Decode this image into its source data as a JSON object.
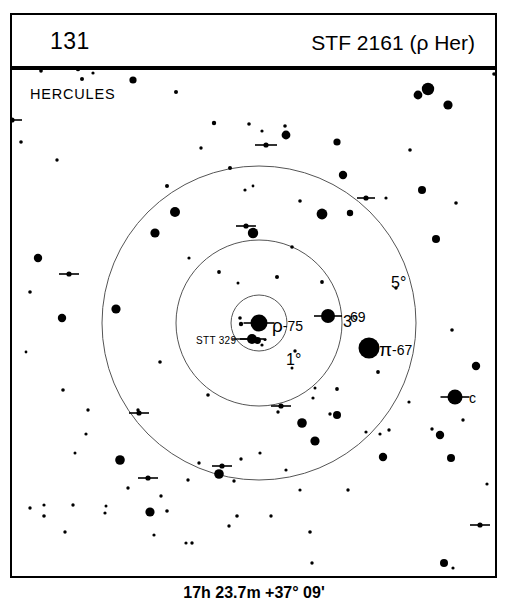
{
  "header": {
    "chart_number": "131",
    "title": "STF 2161 (ρ Her)"
  },
  "caption": "17h 23.7m  +37° 09'",
  "chart": {
    "constellation": "HERCULES",
    "center_ra": "17h 23.7m",
    "center_dec": "+37° 09'",
    "circles": [
      {
        "label": "1°",
        "radius_deg": 1
      },
      {
        "label": "3°",
        "radius_deg": 3
      },
      {
        "label": "5°",
        "radius_deg": 5
      }
    ],
    "star_labels": {
      "rho_greek": "ρ",
      "rho_number": "-75",
      "pi_greek": "π",
      "pi_number": "-67",
      "flamsteed_69": "69",
      "bayer_c": "c",
      "stt329": "STT 329"
    }
  },
  "chart_data": {
    "type": "scatter",
    "title": "STF 2161 (ρ Her)",
    "subtitle": "HERCULES",
    "xlabel": "",
    "ylabel": "",
    "projection": "finder chart, field 10°",
    "center": {
      "x": 259,
      "y": 323,
      "ra": "17h 23.7m",
      "dec": "+37° 09'"
    },
    "grid": false,
    "legend": "none",
    "rings": [
      {
        "label": "1°",
        "radius_px": 28,
        "label_x": 287,
        "label_y": 290
      },
      {
        "label": "3°",
        "radius_px": 83,
        "label_x": 344,
        "label_y": 252
      },
      {
        "label": "5°",
        "radius_px": 157,
        "label_x": 392,
        "label_y": 213
      }
    ],
    "named_stars": [
      {
        "name": "ρ",
        "number": "-75",
        "x": 259,
        "y": 323,
        "r": 8.5,
        "double": true
      },
      {
        "name": "STT 329",
        "x": 252,
        "y": 339,
        "r": 5,
        "double": true
      },
      {
        "name": "69",
        "x": 328,
        "y": 316,
        "r": 7,
        "double": true
      },
      {
        "name": "π",
        "number": "-67",
        "x": 369,
        "y": 348,
        "r": 10.5,
        "double": false
      },
      {
        "name": "c",
        "x": 455,
        "y": 397,
        "r": 7.5,
        "double": true
      }
    ],
    "field_stars": [
      {
        "x": 41,
        "y": 71,
        "r": 1.8
      },
      {
        "x": 78,
        "y": 69,
        "r": 2.2
      },
      {
        "x": 82,
        "y": 79,
        "r": 2.0
      },
      {
        "x": 93,
        "y": 73,
        "r": 1.6
      },
      {
        "x": 133,
        "y": 80,
        "r": 3.6
      },
      {
        "x": 176,
        "y": 92,
        "r": 2.0
      },
      {
        "x": 214,
        "y": 123,
        "r": 2.2
      },
      {
        "x": 249,
        "y": 124,
        "r": 1.8
      },
      {
        "x": 262,
        "y": 131,
        "r": 1.6
      },
      {
        "x": 286,
        "y": 135,
        "r": 4.4
      },
      {
        "x": 285,
        "y": 126,
        "r": 1.8
      },
      {
        "x": 337,
        "y": 142,
        "r": 3.6
      },
      {
        "x": 418,
        "y": 95,
        "r": 4.4
      },
      {
        "x": 428,
        "y": 89,
        "r": 6.2
      },
      {
        "x": 448,
        "y": 105,
        "r": 4.6
      },
      {
        "x": 494,
        "y": 74,
        "r": 1.8
      },
      {
        "x": 167,
        "y": 186,
        "r": 2.0
      },
      {
        "x": 230,
        "y": 168,
        "r": 2.0
      },
      {
        "x": 343,
        "y": 175,
        "r": 4.2
      },
      {
        "x": 410,
        "y": 150,
        "r": 1.8
      },
      {
        "x": 175,
        "y": 212,
        "r": 5.0
      },
      {
        "x": 245,
        "y": 190,
        "r": 1.6
      },
      {
        "x": 253,
        "y": 186,
        "r": 1.4
      },
      {
        "x": 300,
        "y": 201,
        "r": 1.8
      },
      {
        "x": 322,
        "y": 214,
        "r": 5.4
      },
      {
        "x": 350,
        "y": 213,
        "r": 3.2
      },
      {
        "x": 386,
        "y": 198,
        "r": 1.6
      },
      {
        "x": 422,
        "y": 190,
        "r": 4.0
      },
      {
        "x": 456,
        "y": 203,
        "r": 1.8
      },
      {
        "x": 436,
        "y": 239,
        "r": 4.0
      },
      {
        "x": 38,
        "y": 258,
        "r": 4.2
      },
      {
        "x": 30,
        "y": 292,
        "r": 1.8
      },
      {
        "x": 62,
        "y": 318,
        "r": 4.2
      },
      {
        "x": 26,
        "y": 352,
        "r": 1.4
      },
      {
        "x": 116,
        "y": 309,
        "r": 4.6
      },
      {
        "x": 63,
        "y": 390,
        "r": 1.8
      },
      {
        "x": 155,
        "y": 233,
        "r": 4.6
      },
      {
        "x": 189,
        "y": 258,
        "r": 1.6
      },
      {
        "x": 253,
        "y": 233,
        "r": 5.2
      },
      {
        "x": 292,
        "y": 247,
        "r": 1.8
      },
      {
        "x": 219,
        "y": 272,
        "r": 1.9
      },
      {
        "x": 238,
        "y": 283,
        "r": 1.5
      },
      {
        "x": 277,
        "y": 277,
        "r": 2.0
      },
      {
        "x": 322,
        "y": 282,
        "r": 1.9
      },
      {
        "x": 396,
        "y": 288,
        "r": 1.7
      },
      {
        "x": 240,
        "y": 318,
        "r": 1.8
      },
      {
        "x": 262,
        "y": 345,
        "r": 1.6
      },
      {
        "x": 295,
        "y": 351,
        "r": 1.7
      },
      {
        "x": 292,
        "y": 368,
        "r": 1.5
      },
      {
        "x": 160,
        "y": 362,
        "r": 1.8
      },
      {
        "x": 378,
        "y": 372,
        "r": 1.9
      },
      {
        "x": 337,
        "y": 389,
        "r": 1.9
      },
      {
        "x": 138,
        "y": 410,
        "r": 1.7
      },
      {
        "x": 208,
        "y": 395,
        "r": 1.8
      },
      {
        "x": 337,
        "y": 415,
        "r": 4.0
      },
      {
        "x": 366,
        "y": 432,
        "r": 1.6
      },
      {
        "x": 389,
        "y": 430,
        "r": 1.7
      },
      {
        "x": 383,
        "y": 457,
        "r": 4.2
      },
      {
        "x": 440,
        "y": 435,
        "r": 4.2
      },
      {
        "x": 451,
        "y": 458,
        "r": 4.0
      },
      {
        "x": 315,
        "y": 441,
        "r": 4.6
      },
      {
        "x": 330,
        "y": 414,
        "r": 1.7
      },
      {
        "x": 302,
        "y": 423,
        "r": 4.8
      },
      {
        "x": 278,
        "y": 412,
        "r": 1.7
      },
      {
        "x": 313,
        "y": 398,
        "r": 1.6
      },
      {
        "x": 315,
        "y": 388,
        "r": 1.5
      },
      {
        "x": 88,
        "y": 410,
        "r": 1.7
      },
      {
        "x": 86,
        "y": 434,
        "r": 1.6
      },
      {
        "x": 75,
        "y": 453,
        "r": 1.5
      },
      {
        "x": 120,
        "y": 460,
        "r": 4.8
      },
      {
        "x": 128,
        "y": 488,
        "r": 1.7
      },
      {
        "x": 73,
        "y": 505,
        "r": 1.7
      },
      {
        "x": 44,
        "y": 505,
        "r": 1.6
      },
      {
        "x": 106,
        "y": 506,
        "r": 1.5
      },
      {
        "x": 154,
        "y": 535,
        "r": 1.6
      },
      {
        "x": 186,
        "y": 543,
        "r": 1.6
      },
      {
        "x": 219,
        "y": 474,
        "r": 4.8
      },
      {
        "x": 188,
        "y": 480,
        "r": 1.7
      },
      {
        "x": 234,
        "y": 481,
        "r": 1.7
      },
      {
        "x": 199,
        "y": 463,
        "r": 1.7
      },
      {
        "x": 241,
        "y": 459,
        "r": 1.7
      },
      {
        "x": 161,
        "y": 496,
        "r": 1.7
      },
      {
        "x": 260,
        "y": 453,
        "r": 1.6
      },
      {
        "x": 30,
        "y": 508,
        "r": 1.7
      },
      {
        "x": 44,
        "y": 516,
        "r": 1.8
      },
      {
        "x": 65,
        "y": 532,
        "r": 1.7
      },
      {
        "x": 105,
        "y": 513,
        "r": 1.6
      },
      {
        "x": 150,
        "y": 512,
        "r": 4.6
      },
      {
        "x": 167,
        "y": 511,
        "r": 1.8
      },
      {
        "x": 192,
        "y": 543,
        "r": 1.7
      },
      {
        "x": 229,
        "y": 526,
        "r": 1.7
      },
      {
        "x": 237,
        "y": 516,
        "r": 1.8
      },
      {
        "x": 271,
        "y": 516,
        "r": 1.7
      },
      {
        "x": 310,
        "y": 532,
        "r": 1.8
      },
      {
        "x": 312,
        "y": 563,
        "r": 1.7
      },
      {
        "x": 444,
        "y": 563,
        "r": 4.0
      },
      {
        "x": 453,
        "y": 568,
        "r": 1.6
      },
      {
        "x": 286,
        "y": 470,
        "r": 1.6
      },
      {
        "x": 348,
        "y": 490,
        "r": 1.7
      },
      {
        "x": 300,
        "y": 490,
        "r": 1.6
      },
      {
        "x": 487,
        "y": 484,
        "r": 1.6
      },
      {
        "x": 463,
        "y": 420,
        "r": 1.7
      },
      {
        "x": 432,
        "y": 429,
        "r": 1.7
      },
      {
        "x": 476,
        "y": 366,
        "r": 4.2
      },
      {
        "x": 452,
        "y": 330,
        "r": 1.8
      },
      {
        "x": 380,
        "y": 434,
        "r": 1.6
      },
      {
        "x": 409,
        "y": 402,
        "r": 1.6
      },
      {
        "x": 57,
        "y": 160,
        "r": 1.7
      },
      {
        "x": 21,
        "y": 142,
        "r": 1.8
      },
      {
        "x": 201,
        "y": 148,
        "r": 1.7
      }
    ],
    "double_star_markers": [
      {
        "x": 266,
        "y": 145,
        "len": 11
      },
      {
        "x": 246,
        "y": 226,
        "len": 10
      },
      {
        "x": 69,
        "y": 274,
        "len": 10
      },
      {
        "x": 366,
        "y": 198,
        "len": 9
      },
      {
        "x": 281,
        "y": 406,
        "len": 10
      },
      {
        "x": 139,
        "y": 413,
        "len": 10
      },
      {
        "x": 222,
        "y": 466,
        "len": 10
      },
      {
        "x": 148,
        "y": 478,
        "len": 10
      },
      {
        "x": 12,
        "y": 120,
        "len": 10
      },
      {
        "x": 480,
        "y": 525,
        "len": 10
      }
    ]
  }
}
